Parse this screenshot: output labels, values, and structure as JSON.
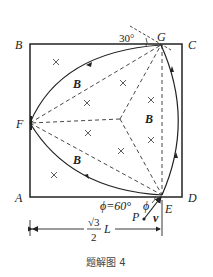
{
  "figure": {
    "caption": "题解图 4",
    "corners": {
      "A": "A",
      "B": "B",
      "C": "C",
      "D": "D"
    },
    "points": {
      "E": "E",
      "F": "F",
      "G": "G",
      "P": "P"
    },
    "field_label": "B",
    "angle_top": "30°",
    "angle_phi_eq": "ϕ=60°",
    "angle_phi": "ϕ",
    "velocity": "v",
    "dimension": {
      "numerator": "√3",
      "denominator": "2",
      "unit": "L"
    }
  }
}
